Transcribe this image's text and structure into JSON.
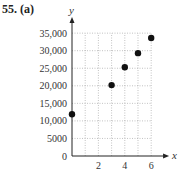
{
  "problem": {
    "label": "55. (a)"
  },
  "chart_data": {
    "type": "scatter",
    "title": "",
    "xlabel": "x",
    "ylabel": "y",
    "x": [
      0,
      3,
      4,
      5,
      6
    ],
    "y": [
      11900,
      20200,
      25300,
      29300,
      33600
    ],
    "xlim": [
      0,
      6.5
    ],
    "ylim": [
      0,
      35000
    ],
    "x_ticks": [
      "2",
      "4",
      "6"
    ],
    "y_ticks": [
      "0",
      "5000",
      "10,000",
      "15,000",
      "20,000",
      "25,000",
      "30,000",
      "35,000"
    ],
    "grid": true,
    "grid_style": "dotted",
    "legend": null,
    "marker_color": "#111111"
  }
}
